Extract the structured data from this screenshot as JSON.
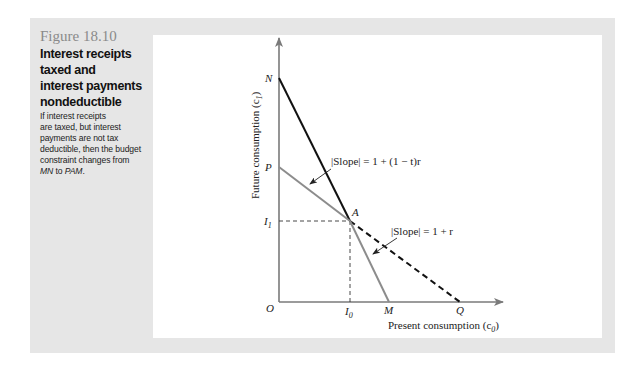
{
  "caption": {
    "figure_number": "Figure 18.10",
    "title_lines": [
      "Interest receipts",
      "taxed and",
      "interest payments",
      "nondeductible"
    ],
    "body_lines": [
      "If interest receipts",
      "are taxed, but interest",
      "payments are not tax",
      "deductible, then the budget",
      "constraint changes from"
    ],
    "body_last_line": {
      "from": "MN",
      "to_word": " to ",
      "to": "PAM",
      "end": "."
    }
  },
  "diagram": {
    "y_axis_label": "Future consumption (c",
    "y_axis_sub": "1",
    "x_axis_label": "Present consumption (c",
    "x_axis_sub": "0",
    "axis_close": ")",
    "points": {
      "origin": "O",
      "N": "N",
      "P": "P",
      "I1": "I",
      "I1_sub": "1",
      "A": "A",
      "I0": "I",
      "I0_sub": "0",
      "M": "M",
      "Q": "Q"
    },
    "annotations": {
      "slope_after_tax": "|Slope| = 1 + (1 − t)r",
      "slope_pre_tax": "|Slope| = 1 + r"
    },
    "colors": {
      "axis": "#7a7a7a",
      "original_constraint": "#111111",
      "new_constraint": "#8c8c8c",
      "dashed": "#111111"
    }
  }
}
